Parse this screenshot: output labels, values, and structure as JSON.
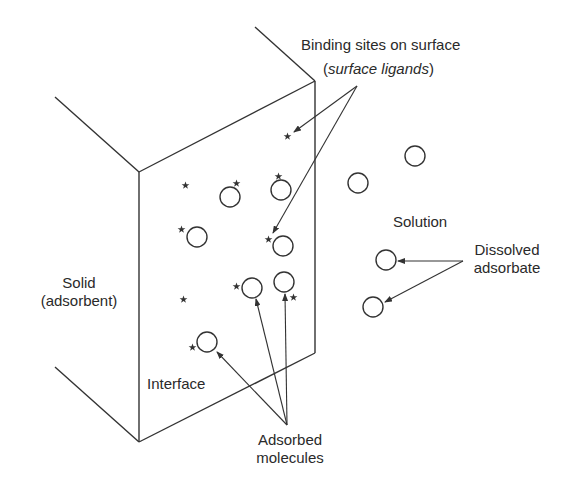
{
  "diagram": {
    "labels": {
      "binding_sites_line1": "Binding sites on surface",
      "binding_sites_paren_open": "(",
      "binding_sites_line2": "surface ligands",
      "binding_sites_paren_close": ")",
      "solid_line1": "Solid",
      "solid_line2": "(adsorbent)",
      "interface": "Interface",
      "solution": "Solution",
      "dissolved_line1": "Dissolved",
      "dissolved_line2": "adsorbate",
      "adsorbed_line1": "Adsorbed",
      "adsorbed_line2": "molecules"
    },
    "colors": {
      "stroke": "#333333",
      "background": "#ffffff"
    }
  }
}
